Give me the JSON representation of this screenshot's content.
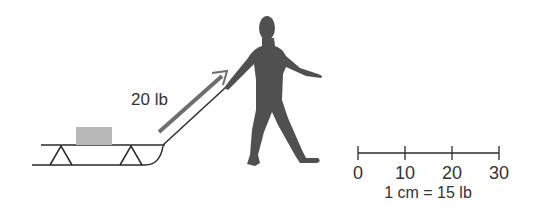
{
  "diagram": {
    "force_label": "20 lb",
    "scale": {
      "ticks": [
        "0",
        "10",
        "20",
        "30"
      ],
      "caption": "1 cm = 15 lb"
    },
    "colors": {
      "line": "#2a2a2a",
      "arrow": "#6e6e6e",
      "box": "#b8b8b8",
      "person": "#505050",
      "text": "#333333"
    }
  }
}
